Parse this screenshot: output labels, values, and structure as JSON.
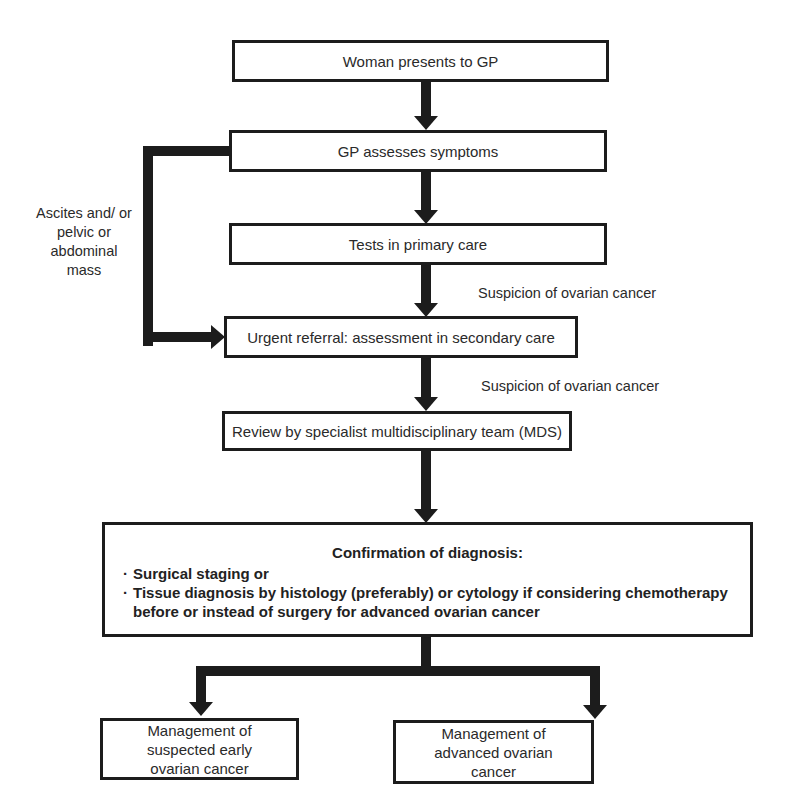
{
  "diagram": {
    "type": "flowchart",
    "nodes": {
      "presents": "Woman presents to GP",
      "assesses": "GP assesses symptoms",
      "tests": "Tests in primary care",
      "referral": "Urgent referral: assessment in secondary care",
      "review": "Review by specialist multidisciplinary team (MDS)",
      "confirmation": {
        "title": "Confirmation of diagnosis:",
        "bullets": [
          "Surgical staging or",
          "Tissue diagnosis by histology (preferably) or cytology if considering chemotherapy before or instead of surgery for advanced ovarian cancer"
        ]
      },
      "early": "Management of suspected early ovarian cancer",
      "advanced": "Management of advanced ovarian cancer"
    },
    "edge_labels": {
      "tests_to_referral": "Suspicion of ovarian cancer",
      "referral_to_review": "Suspicion of ovarian cancer",
      "bypass": "Ascites and/ or pelvic or abdominal mass"
    },
    "edges": [
      {
        "from": "presents",
        "to": "assesses"
      },
      {
        "from": "assesses",
        "to": "tests"
      },
      {
        "from": "assesses",
        "to": "referral",
        "label": "Ascites and/ or pelvic or abdominal mass"
      },
      {
        "from": "tests",
        "to": "referral",
        "label": "Suspicion of ovarian cancer"
      },
      {
        "from": "referral",
        "to": "review",
        "label": "Suspicion of ovarian cancer"
      },
      {
        "from": "review",
        "to": "confirmation"
      },
      {
        "from": "confirmation",
        "to": "early"
      },
      {
        "from": "confirmation",
        "to": "advanced"
      }
    ]
  }
}
